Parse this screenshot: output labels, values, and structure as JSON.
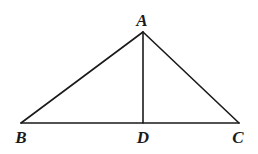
{
  "diagram": {
    "type": "geometry-triangle",
    "points": {
      "A": {
        "label": "A",
        "x": 143,
        "y": 32,
        "label_x": 142,
        "label_y": 26
      },
      "B": {
        "label": "B",
        "x": 21,
        "y": 123,
        "label_x": 21,
        "label_y": 143
      },
      "C": {
        "label": "C",
        "x": 239,
        "y": 123,
        "label_x": 238,
        "label_y": 143
      },
      "D": {
        "label": "D",
        "x": 143,
        "y": 123,
        "label_x": 143,
        "label_y": 143
      }
    },
    "segments": [
      "AB",
      "AC",
      "BC",
      "AD"
    ],
    "colors": {
      "stroke": "#1a1a1a",
      "background": "#ffffff"
    }
  }
}
